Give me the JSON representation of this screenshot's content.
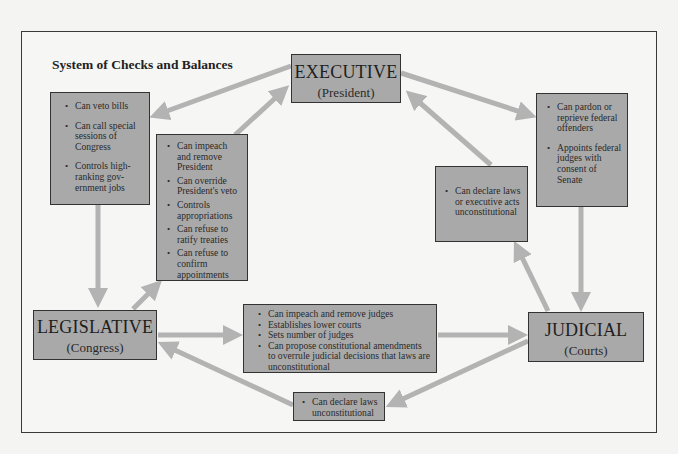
{
  "title": "System of Checks and Balances",
  "branches": {
    "executive": {
      "name": "EXECUTIVE",
      "sub": "(President)"
    },
    "legislative": {
      "name": "LEGISLATIVE",
      "sub": "(Congress)"
    },
    "judicial": {
      "name": "JUDICIAL",
      "sub": "(Courts)"
    }
  },
  "checks": {
    "executive_on_legislative": [
      "Can veto bills",
      "Can call special sessions of Congress",
      "Controls high-ranking gov-ernment jobs"
    ],
    "legislative_on_executive": [
      "Can impeach and remove President",
      "Can override President's veto",
      "Controls appropriations",
      "Can refuse to ratify treaties",
      "Can refuse to confirm appointments"
    ],
    "executive_on_judicial": [
      "Can pardon or reprieve federal offenders",
      "Appoints federal judges with consent of Senate"
    ],
    "judicial_on_executive": [
      "Can declare laws or executive acts unconstitutional"
    ],
    "legislative_on_judicial": [
      "Can impeach and remove judges",
      "Establishes lower courts",
      "Sets number of judges",
      "Can propose constitutional amendments to overrule judicial decisions that laws are unconstitutional"
    ],
    "judicial_on_legislative": [
      "Can declare laws unconstitutional"
    ]
  },
  "colors": {
    "box_fill": "#a9a9a9",
    "arrow": "#b3b3b3",
    "border": "#333333"
  }
}
